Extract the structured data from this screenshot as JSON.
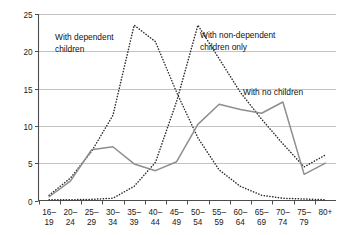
{
  "chart_data": {
    "type": "line",
    "title": "",
    "subtitle": "",
    "xlabel": "",
    "ylabel": "",
    "xlim": [
      0,
      13
    ],
    "ylim": [
      0,
      25
    ],
    "yticks": [
      0,
      5,
      10,
      15,
      20,
      25
    ],
    "grid": "horizontal",
    "legend": "inline-annotations",
    "categories": [
      "16–19",
      "20–24",
      "25–29",
      "30–34",
      "35–39",
      "40–44",
      "45–49",
      "50–54",
      "55–59",
      "60–64",
      "65–69",
      "70–74",
      "75–79",
      "80+"
    ],
    "category_lines": [
      [
        "16–",
        "19"
      ],
      [
        "20–",
        "24"
      ],
      [
        "25–",
        "29"
      ],
      [
        "30–",
        "34"
      ],
      [
        "35–",
        "39"
      ],
      [
        "40–",
        "44"
      ],
      [
        "45–",
        "49"
      ],
      [
        "50–",
        "54"
      ],
      [
        "55–",
        "59"
      ],
      [
        "60–",
        "64"
      ],
      [
        "65–",
        "69"
      ],
      [
        "70–",
        "74"
      ],
      [
        "75–",
        "79"
      ],
      [
        "80+",
        ""
      ]
    ],
    "series": [
      {
        "name": "With dependent children",
        "style": "dotted",
        "color": "#2b2b2b",
        "values": [
          0.7,
          3.0,
          6.6,
          11.4,
          23.5,
          21.3,
          14.5,
          8.4,
          4.1,
          1.9,
          0.7,
          0.3,
          0.2,
          0.1
        ]
      },
      {
        "name": "With non-dependent children only",
        "style": "dotted",
        "color": "#2b2b2b",
        "values": [
          0.1,
          0.1,
          0.15,
          0.3,
          1.9,
          5.1,
          13.3,
          23.5,
          19.0,
          14.5,
          10.9,
          7.6,
          4.5,
          6.1
        ]
      },
      {
        "name": "With no children",
        "style": "solid",
        "color": "#8e8e8e",
        "values": [
          0.5,
          2.6,
          6.8,
          7.2,
          4.9,
          4.0,
          5.2,
          10.2,
          12.9,
          12.2,
          11.7,
          13.2,
          3.5,
          5.0
        ]
      }
    ],
    "annotations": [
      {
        "id": "annotation-dependent-children",
        "lines": [
          "With dependent",
          "children"
        ],
        "x": 55,
        "y": 40
      },
      {
        "id": "annotation-non-dependent-children",
        "lines": [
          "With non-dependent",
          "children only"
        ],
        "x": 200,
        "y": 38
      },
      {
        "id": "annotation-no-children",
        "lines": [
          "With no children"
        ],
        "x": 243,
        "y": 95
      }
    ],
    "colors": {
      "gridline": "#a9a9a9",
      "axis": "#4d4d4d",
      "solid_series": "#8e8e8e",
      "dotted_series": "#2b2b2b",
      "background": "#ffffff"
    }
  }
}
